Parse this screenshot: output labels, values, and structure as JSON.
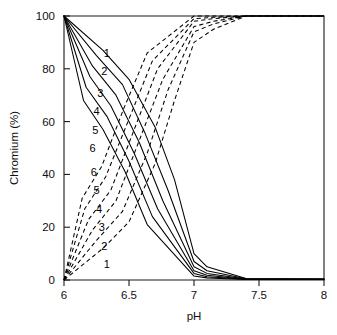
{
  "chart_data": {
    "type": "line",
    "title": "",
    "xlabel": "pH",
    "ylabel": "Chromium (%)",
    "xlim": [
      6,
      8
    ],
    "ylim": [
      0,
      100
    ],
    "xticks": [
      "6",
      "6.5",
      "7",
      "7.5",
      "8"
    ],
    "xtick_values": [
      6,
      6.5,
      7,
      7.5,
      8
    ],
    "yticks": [
      "0",
      "20",
      "40",
      "60",
      "80",
      "100"
    ],
    "ytick_values": [
      0,
      20,
      40,
      60,
      80,
      100
    ],
    "grid": false,
    "legend_position": "inline-curve-labels",
    "linestyles": {
      "solid": "solid",
      "dashed": "dashed"
    },
    "annotations": [
      {
        "text": "1",
        "x": 6.33,
        "y": 86,
        "series": "solid-1"
      },
      {
        "text": "2",
        "x": 6.31,
        "y": 79,
        "series": "solid-2"
      },
      {
        "text": "3",
        "x": 6.28,
        "y": 71,
        "series": "solid-3"
      },
      {
        "text": "4",
        "x": 6.25,
        "y": 64,
        "series": "solid-4"
      },
      {
        "text": "5",
        "x": 6.24,
        "y": 57,
        "series": "solid-5"
      },
      {
        "text": "6",
        "x": 6.22,
        "y": 50,
        "series": "solid-6"
      },
      {
        "text": "6",
        "x": 6.23,
        "y": 41,
        "series": "dashed-6"
      },
      {
        "text": "5",
        "x": 6.25,
        "y": 34,
        "series": "dashed-5"
      },
      {
        "text": "4",
        "x": 6.27,
        "y": 27,
        "series": "dashed-4"
      },
      {
        "text": "3",
        "x": 6.29,
        "y": 20,
        "series": "dashed-3"
      },
      {
        "text": "2",
        "x": 6.31,
        "y": 13,
        "series": "dashed-2"
      },
      {
        "text": "1",
        "x": 6.33,
        "y": 6,
        "series": "dashed-1"
      }
    ],
    "series": [
      {
        "name": "1",
        "style": "solid",
        "label": "1",
        "x": [
          6.0,
          6.3,
          6.5,
          6.7,
          6.85,
          7.0,
          7.1,
          7.4,
          8.0
        ],
        "values": [
          100,
          87,
          76,
          58,
          38,
          10,
          5,
          0.6,
          0.4
        ]
      },
      {
        "name": "2",
        "style": "solid",
        "label": "2",
        "x": [
          6.0,
          6.25,
          6.45,
          6.62,
          6.8,
          7.0,
          7.1,
          7.4,
          8.0
        ],
        "values": [
          100,
          85,
          74,
          56,
          34,
          7,
          3.5,
          0.5,
          0.4
        ]
      },
      {
        "name": "3",
        "style": "solid",
        "label": "3",
        "x": [
          6.0,
          6.22,
          6.4,
          6.58,
          6.76,
          7.0,
          7.1,
          7.4,
          8.0
        ],
        "values": [
          100,
          81,
          70,
          52,
          30,
          5,
          2.5,
          0.4,
          0.3
        ]
      },
      {
        "name": "4",
        "style": "solid",
        "label": "4",
        "x": [
          6.0,
          6.2,
          6.36,
          6.54,
          6.72,
          7.0,
          7.1,
          7.4,
          8.0
        ],
        "values": [
          100,
          77,
          66,
          48,
          27,
          3.5,
          1.8,
          0.3,
          0.3
        ]
      },
      {
        "name": "5",
        "style": "solid",
        "label": "5",
        "x": [
          6.0,
          6.17,
          6.33,
          6.5,
          6.68,
          7.0,
          7.1,
          7.4,
          8.0
        ],
        "values": [
          100,
          73,
          62,
          45,
          24,
          2.5,
          1.2,
          0.25,
          0.2
        ]
      },
      {
        "name": "6",
        "style": "solid",
        "label": "6",
        "x": [
          6.0,
          6.15,
          6.3,
          6.47,
          6.64,
          7.0,
          7.1,
          7.4,
          8.0
        ],
        "values": [
          100,
          68,
          57,
          41,
          21,
          1.5,
          0.8,
          0.2,
          0.2
        ]
      },
      {
        "name": "1-rev",
        "style": "dashed",
        "label": "1",
        "x": [
          6.0,
          6.3,
          6.5,
          6.7,
          6.85,
          7.0,
          7.15,
          7.4,
          8.0
        ],
        "values": [
          0,
          12,
          22,
          44,
          68,
          90,
          95,
          100,
          100
        ]
      },
      {
        "name": "2-rev",
        "style": "dashed",
        "label": "2",
        "x": [
          6.0,
          6.25,
          6.45,
          6.64,
          6.8,
          7.0,
          7.15,
          7.4,
          8.0
        ],
        "values": [
          0,
          15,
          26,
          48,
          72,
          94,
          97,
          100,
          100
        ]
      },
      {
        "name": "3-rev",
        "style": "dashed",
        "label": "3",
        "x": [
          6.0,
          6.22,
          6.4,
          6.58,
          6.76,
          7.0,
          7.15,
          7.4,
          8.0
        ],
        "values": [
          0,
          19,
          30,
          53,
          76,
          96,
          98,
          100,
          100
        ]
      },
      {
        "name": "4-rev",
        "style": "dashed",
        "label": "4",
        "x": [
          6.0,
          6.19,
          6.36,
          6.54,
          6.72,
          7.0,
          7.15,
          7.4,
          8.0
        ],
        "values": [
          0,
          23,
          34,
          57,
          80,
          98,
          99,
          100,
          100
        ]
      },
      {
        "name": "5-rev",
        "style": "dashed",
        "label": "5",
        "x": [
          6.0,
          6.16,
          6.32,
          6.5,
          6.68,
          7.0,
          7.15,
          7.4,
          8.0
        ],
        "values": [
          0,
          27,
          39,
          61,
          83,
          99,
          99.5,
          100,
          100
        ]
      },
      {
        "name": "6-rev",
        "style": "dashed",
        "label": "6",
        "x": [
          6.0,
          6.14,
          6.29,
          6.46,
          6.64,
          7.0,
          7.15,
          7.4,
          8.0
        ],
        "values": [
          0,
          31,
          43,
          65,
          86,
          100,
          100,
          100,
          100
        ]
      }
    ]
  }
}
